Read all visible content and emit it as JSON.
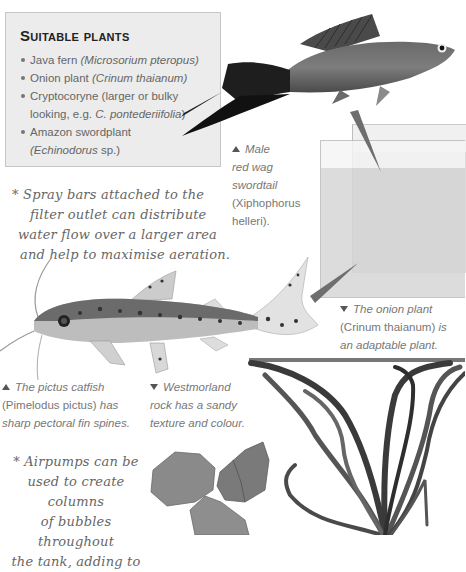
{
  "plants_box": {
    "title": "Suitable plants",
    "items": [
      {
        "common": "Java fern",
        "latin": "(Microsorium pteropus)"
      },
      {
        "common": "Onion plant",
        "latin": "(Crinum thaianum)"
      },
      {
        "common": "Cryptocoryne (larger or bulky",
        "continuation": "looking, e.g.",
        "latin": "C. pontederiifolia",
        "close": ")"
      },
      {
        "common": "Amazon swordplant",
        "latin": "(Echinodorus",
        "suffix": "sp.)"
      }
    ]
  },
  "captions": {
    "swordtail": {
      "arrow": "up",
      "line1": "Male",
      "line2": "red wag",
      "line3": "swordtail",
      "line4": "(Xiphophorus",
      "line5": "helleri)."
    },
    "onion_plant": {
      "arrow": "down",
      "line1": "The onion plant",
      "line2_plain": "(Crinum thaianum)",
      "line2_italic": "is",
      "line3": "an adaptable plant."
    },
    "catfish": {
      "arrow": "up",
      "line1": "The pictus catfish",
      "line2_plain": "(Pimelodus pictus)",
      "line2_italic": "has",
      "line3": "sharp pectoral fin spines."
    },
    "rock": {
      "arrow": "down",
      "line1": "Westmorland",
      "line2": "rock has a sandy",
      "line3": "texture and colour."
    }
  },
  "notes": {
    "spray_bars": [
      "* Spray bars attached to the",
      "filter outlet can distribute",
      "water flow over a larger area",
      "and help to maximise aeration."
    ],
    "airpumps": [
      "* Airpumps can be",
      "used to create columns",
      "of bubbles throughout",
      "the tank, adding to"
    ]
  },
  "images": {
    "swordtail": "red-wag-swordtail-photo",
    "tank": "aquarium-tank-illustration",
    "catfish": "pictus-catfish-photo",
    "onion_plant": "onion-plant-photo",
    "rocks": "westmorland-rock-photo"
  },
  "colors": {
    "box_bg": "#ececec",
    "box_border": "#c6c6c6",
    "title": "#222222",
    "body_text": "#666666",
    "pointer": "#666666"
  }
}
